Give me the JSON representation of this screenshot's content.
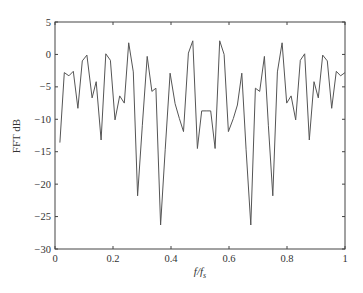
{
  "chart_data": {
    "type": "line",
    "title": "",
    "xlabel": "f/f_s",
    "xlabel_main": "f/f",
    "xlabel_sub": "s",
    "ylabel": "FFT dB",
    "xlim": [
      0,
      1
    ],
    "ylim": [
      -30,
      5
    ],
    "grid": false,
    "legend": null,
    "x_ticks": [
      0,
      0.2,
      0.4,
      0.6,
      0.8,
      1
    ],
    "x_tick_labels": [
      "0",
      "0.2",
      "0.4",
      "0.6",
      "0.8",
      "1"
    ],
    "y_ticks": [
      5,
      0,
      -5,
      -10,
      -15,
      -20,
      -25,
      -30
    ],
    "y_tick_labels": [
      "5",
      "0",
      "−5",
      "−10",
      "−15",
      "−20",
      "−25",
      "−30"
    ],
    "line_color": "#555555",
    "series": [
      {
        "name": "FFT",
        "x": [
          0.017,
          0.032,
          0.048,
          0.063,
          0.079,
          0.094,
          0.11,
          0.128,
          0.142,
          0.159,
          0.175,
          0.191,
          0.207,
          0.223,
          0.239,
          0.254,
          0.27,
          0.285,
          0.301,
          0.318,
          0.334,
          0.348,
          0.364,
          0.38,
          0.397,
          0.414,
          0.429,
          0.443,
          0.46,
          0.475,
          0.491,
          0.506,
          0.521,
          0.537,
          0.552,
          0.568,
          0.583,
          0.598,
          0.615,
          0.629,
          0.644,
          0.659,
          0.675,
          0.691,
          0.706,
          0.722,
          0.736,
          0.751,
          0.767,
          0.783,
          0.799,
          0.814,
          0.83,
          0.846,
          0.861,
          0.877,
          0.893,
          0.908,
          0.923,
          0.939,
          0.954,
          0.97,
          0.985,
          1.0
        ],
        "values": [
          -13.6,
          -2.8,
          -3.3,
          -2.6,
          -8.3,
          -1.0,
          -0.1,
          -6.7,
          -4.2,
          -13.2,
          0.1,
          -0.9,
          -10.1,
          -6.4,
          -7.5,
          1.8,
          -2.7,
          -21.8,
          -11.0,
          -0.3,
          -5.7,
          -5.2,
          -26.3,
          -14.7,
          -2.9,
          -7.6,
          -9.9,
          -11.9,
          0.2,
          2.1,
          -14.5,
          -8.7,
          -8.7,
          -8.7,
          -14.5,
          2.1,
          0.0,
          -11.9,
          -9.9,
          -7.8,
          -2.9,
          -14.7,
          -26.3,
          -5.2,
          -5.7,
          -0.3,
          -11.0,
          -21.8,
          -2.7,
          1.8,
          -7.5,
          -6.4,
          -10.1,
          -0.9,
          0.1,
          -13.2,
          -4.2,
          -6.7,
          -0.1,
          -1.0,
          -8.3,
          -2.6,
          -3.3,
          -2.8
        ]
      }
    ]
  }
}
